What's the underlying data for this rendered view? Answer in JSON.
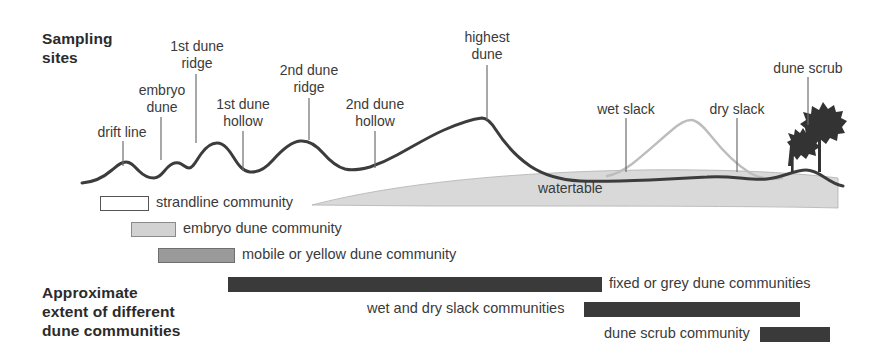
{
  "headings": {
    "sampling_sites": "Sampling\nsites",
    "extent": "Approximate\nextent of different\ndune communities"
  },
  "profile": {
    "watertable_label": "watertable",
    "colors": {
      "dune_profile_line": "#3c3c3c",
      "slack_profile_line": "#b9b9b9",
      "watertable_fill": "#d9d9d9",
      "tree_silhouette": "#333333",
      "leader_line": "#6e6e6e"
    }
  },
  "sampling_sites": [
    {
      "label": "drift line",
      "label_x": 82,
      "label_y": 124,
      "width": 80,
      "leader_x": 123,
      "leader_top": 141,
      "leader_bottom": 166
    },
    {
      "label": "embryo\ndune",
      "label_x": 117,
      "label_y": 82,
      "width": 90,
      "leader_x": 161,
      "leader_top": 117,
      "leader_bottom": 160
    },
    {
      "label": "1st dune\nridge",
      "label_x": 152,
      "label_y": 38,
      "width": 90,
      "leader_x": 196,
      "leader_top": 74,
      "leader_bottom": 143
    },
    {
      "label": "1st dune\nhollow",
      "label_x": 198,
      "label_y": 96,
      "width": 90,
      "leader_x": 243,
      "leader_top": 131,
      "leader_bottom": 171
    },
    {
      "label": "2nd dune\nridge",
      "label_x": 264,
      "label_y": 62,
      "width": 90,
      "leader_x": 309,
      "leader_top": 98,
      "leader_bottom": 140
    },
    {
      "label": "2nd dune\nhollow",
      "label_x": 330,
      "label_y": 96,
      "width": 90,
      "leader_x": 375,
      "leader_top": 131,
      "leader_bottom": 168
    },
    {
      "label": "highest\ndune",
      "label_x": 442,
      "label_y": 29,
      "width": 90,
      "leader_x": 487,
      "leader_top": 65,
      "leader_bottom": 120
    },
    {
      "label": "wet slack",
      "label_x": 581,
      "label_y": 101,
      "width": 90,
      "leader_x": 626,
      "leader_top": 118,
      "leader_bottom": 172
    },
    {
      "label": "dry slack",
      "label_x": 692,
      "label_y": 101,
      "width": 90,
      "leader_x": 737,
      "leader_top": 118,
      "leader_bottom": 172
    },
    {
      "label": "dune scrub",
      "label_x": 753,
      "label_y": 60,
      "width": 110,
      "leader_x": 808,
      "leader_top": 77,
      "leader_bottom": 125
    }
  ],
  "community_bars": [
    {
      "name": "strandline community",
      "label": "strandline community",
      "style": "bar-white",
      "bar_x": 100,
      "bar_y": 196,
      "bar_w": 49,
      "label_x": 156,
      "label_y": 194,
      "label_align": "left"
    },
    {
      "name": "embryo dune community",
      "label": "embryo dune community",
      "style": "bar-light",
      "bar_x": 131,
      "bar_y": 222,
      "bar_w": 45,
      "label_x": 183,
      "label_y": 220,
      "label_align": "left"
    },
    {
      "name": "mobile or yellow dune community",
      "label": "mobile or yellow dune community",
      "style": "bar-mid",
      "bar_x": 158,
      "bar_y": 248,
      "bar_w": 77,
      "label_x": 242,
      "label_y": 246,
      "label_align": "left"
    },
    {
      "name": "fixed or grey dune communities",
      "label": "fixed or grey dune communities",
      "style": "bar-dark",
      "bar_x": 228,
      "bar_y": 277,
      "bar_w": 374,
      "label_x": 609,
      "label_y": 275,
      "label_align": "left"
    },
    {
      "name": "wet and dry slack communities",
      "label": "wet and dry slack communities",
      "style": "bar-dark",
      "bar_x": 584,
      "bar_y": 302,
      "bar_w": 216,
      "label_x": 367,
      "label_y": 300,
      "label_align": "left"
    },
    {
      "name": "dune scrub community",
      "label": "dune scrub community",
      "style": "bar-dark",
      "bar_x": 760,
      "bar_y": 327,
      "bar_w": 70,
      "label_x": 604,
      "label_y": 325,
      "label_align": "left"
    }
  ]
}
